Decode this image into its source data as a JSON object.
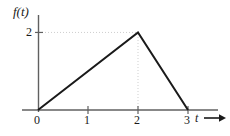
{
  "figure": {
    "background_color": "#ffffff",
    "curve_color": "#1a1a1a",
    "axis_color": "#555555",
    "guide_color": "#cfcfcf"
  },
  "axes": {
    "y_label": "f(t)",
    "x_label": "t",
    "x_arrow_glyph": "arrow-right-icon",
    "y_ticks": [
      {
        "value": 2,
        "label": "2"
      }
    ],
    "x_ticks": [
      {
        "value": 0,
        "label": "0"
      },
      {
        "value": 1,
        "label": "1"
      },
      {
        "value": 2,
        "label": "2"
      },
      {
        "value": 3,
        "label": "3"
      }
    ]
  },
  "chart_data": {
    "type": "line",
    "title": "",
    "xlabel": "t",
    "ylabel": "f(t)",
    "xlim": [
      0,
      3.6
    ],
    "ylim": [
      0,
      2.45
    ],
    "grid": false,
    "legend": null,
    "xticks": [
      0,
      1,
      2,
      3
    ],
    "xticklabels": [
      "0",
      "1",
      "2",
      "3"
    ],
    "yticks": [
      2
    ],
    "yticklabels": [
      "2"
    ],
    "series": [
      {
        "name": "f(t)",
        "x": [
          0,
          2,
          3
        ],
        "y": [
          0,
          2,
          0
        ],
        "color": "#1a1a1a",
        "linewidth": 2
      }
    ],
    "annotations": [
      {
        "type": "guide-line",
        "orientation": "horizontal",
        "from": [
          0,
          2
        ],
        "to": [
          2,
          2
        ],
        "style": "dotted"
      },
      {
        "type": "guide-line",
        "orientation": "vertical",
        "from": [
          2,
          0
        ],
        "to": [
          2,
          2
        ],
        "style": "dotted"
      }
    ]
  }
}
